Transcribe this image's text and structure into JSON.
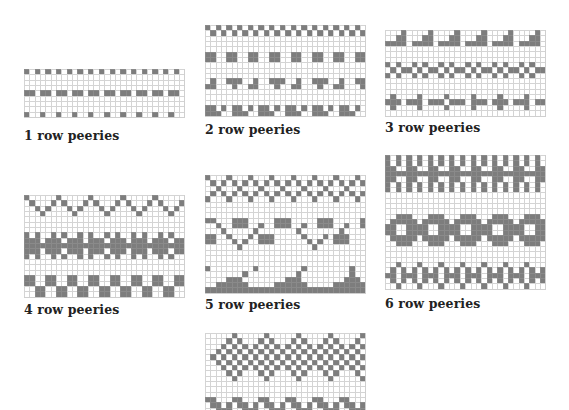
{
  "colors": {
    "fill": "#7d7d7d",
    "grid": "#d4d4d4",
    "background": "#ffffff",
    "label": "#222222"
  },
  "charts": [
    {
      "id": "chart-1",
      "label": "1 row peeries",
      "x": 24,
      "y": 69,
      "cell": 5.35,
      "label_x": 24,
      "label_y": 128,
      "rows": [
        "101010101010101010101010101010",
        "000000000000000000000000000000",
        "000000000000000000000000000000",
        "000000000000000000000000000000",
        "110110110110110110110110110110",
        "000000000000000000000000000000",
        "000000000000000000000000000000",
        "000000000000000000000000000000",
        "100100100100100100100100100100"
      ]
    },
    {
      "id": "chart-2",
      "label": "2 row peeries",
      "x": 205,
      "y": 25,
      "cell": 5.35,
      "label_x": 205,
      "label_y": 122,
      "rows": [
        "101010101010101010101010101010",
        "010101010101010101010101010101",
        "000000000000000000000000000000",
        "000000000000000000000000000000",
        "000000000000000000000000000000",
        "110011001100110011001100110011",
        "110011001100110011001100110011",
        "000000000000000000000000000000",
        "000000000000000000000000000000",
        "000000000000000000000000000000",
        "010011100100111001001110010011",
        "110001001100010011000100110001",
        "000000000000000000000000000000",
        "000000000000000000000000000000",
        "000000000000000000000000000000",
        "110101101011010110101101011010",
        "111001110011100111001110011100"
      ]
    },
    {
      "id": "chart-3",
      "label": "3 row peeries",
      "x": 385,
      "y": 30,
      "cell": 5.35,
      "label_x": 385,
      "label_y": 120,
      "rows": [
        "000100001000010000100001000010",
        "001100011000110001100011000110",
        "111101111011110111101111011110",
        "000000000000000000000000000000",
        "000000000000000000000000000000",
        "000000000000000000000000000000",
        "101001010010100101001010010100",
        "010110101101011010110101101011",
        "101001010010100101001010010100",
        "000000000000000000000000000000",
        "000000000000000000000000000000",
        "000000000000000000000000000000",
        "010000100001000010000100001000",
        "111011101110111011101110111011",
        "010000100001000010000100001000",
        "000000000000000000000000000000"
      ]
    },
    {
      "id": "chart-4",
      "label": "4 row peeries",
      "x": 24,
      "y": 195,
      "cell": 5.35,
      "label_x": 24,
      "label_y": 302,
      "rows": [
        "100000100000100000100000100000",
        "010001010001010001010001010001",
        "001010001010001010001010001010",
        "000100000100000100000100000100",
        "000000000000000000000000000000",
        "000000000000000000000000000000",
        "000000000000000000000000000000",
        "101001010010100101001010010100",
        "111011101110111011101110111011",
        "111111111111111111111111111111",
        "111011101110111011101110111011",
        "101001010010100101001010010100",
        "000000000000000000000000000000",
        "000000000000000000000000000000",
        "000000000000000000000000000000",
        "110011001100110011001100110011",
        "110011001100110011001100110011",
        "001100110011001100110011001100",
        "001100110011001100110011001100"
      ]
    },
    {
      "id": "chart-5",
      "label": "5 row peeries",
      "x": 205,
      "y": 175,
      "cell": 5.35,
      "label_x": 205,
      "label_y": 297,
      "rows": [
        "100010001000100010001000100010",
        "010101010101010101010101010101",
        "001000100010001000100010001000",
        "010101010101010101010101010101",
        "100010001000100010001000100010",
        "000000000000000000000000000000",
        "000000000000000000000000000000",
        "000000000000000000000000000000",
        "110001110000011100000111000001",
        "001001110010011100100111001001",
        "000100000100000001000000010000",
        "110010001011100000100010111000",
        "110001010011100000010100111000",
        "000000100000000000001000000000",
        "000000000000000000000000000000",
        "000000000000000000000000000000",
        "000000000000000000000000000000",
        "100000000100000000100000000100",
        "000000010000000001000000000100",
        "000011100000000111000000001110",
        "001111110000011111100000111111",
        "111111111111111111111111111111"
      ]
    },
    {
      "id": "chart-6",
      "label": "6 row peeries",
      "x": 385,
      "y": 155,
      "cell": 5.35,
      "label_x": 385,
      "label_y": 296,
      "rows": [
        "101010101010101010101010101010",
        "101010101010101010101010101010",
        "110011001100110011001100110011",
        "111111111111111111111111111111",
        "110011001100110011001100110011",
        "101010101010101010101010101010",
        "101010101010101010101010101010",
        "000000000000000000000000000000",
        "000000000000000000000000000000",
        "000000000000000000000000000000",
        "000000000000000000000000000000",
        "001110001110001110001110001110",
        "011111011111011111011111011111",
        "110011110011110011110011110011",
        "110011110011110011110011110011",
        "011111011111011111011111011111",
        "001110001110001110001110001110",
        "000000000000000000000000000000",
        "000000000000000000000000000000",
        "000000000000000000000000000000",
        "001000100010001000100010001000",
        "010101010101010101010101010101",
        "110111011101110111011101110111",
        "010101010101010101010101010101",
        "001000100010001000100010001000"
      ]
    },
    {
      "id": "chart-7",
      "label": "",
      "x": 205,
      "y": 333,
      "cell": 5.35,
      "label_x": 205,
      "label_y": 420,
      "rows": [
        "000001000001000001000001000001",
        "000010100010100010100010100010",
        "000101010101010101010101010101",
        "001010101010101010101010101010",
        "010101010101010101010101010101",
        "001010101010101010101010101010",
        "000101010101010101010101010101",
        "000010100010100010100010100010",
        "000001000001000001000001000001",
        "000000000000000000000000000000",
        "000000000000000000000000000000",
        "000000000000000000000000000000",
        "110001100011000110001100011000",
        "011010110101101011010110101101",
        "001110011100111001110011100111"
      ]
    }
  ]
}
